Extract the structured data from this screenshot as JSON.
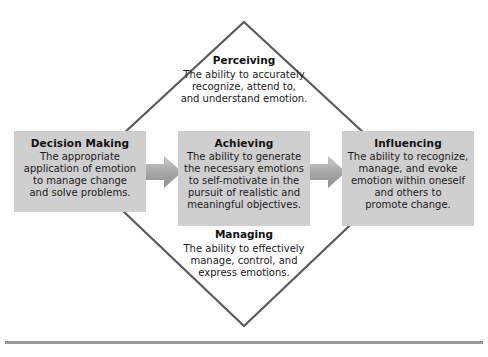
{
  "diagram": {
    "type": "emotional-intelligence-model",
    "shape": "diamond",
    "colors": {
      "box_fill": "#cfcfcf",
      "outline": "#5a5a5a",
      "arrow_fill": "#b0b0b0",
      "rule": "#9a9a9a",
      "text": "#1a1a1a"
    },
    "boxes": [
      {
        "id": "decision-making",
        "title": "Decision Making",
        "description": "The appropriate\napplication of emotion\nto manage change\nand solve problems."
      },
      {
        "id": "achieving",
        "title": "Achieving",
        "description": "The ability to generate\nthe necessary emotions\nto self-motivate in the\npursuit of realistic and\nmeaningful objectives."
      },
      {
        "id": "influencing",
        "title": "Influencing",
        "description": "The ability to recognize,\nmanage, and evoke\nemotion within oneself\nand others to\npromote change."
      }
    ],
    "free_texts": [
      {
        "id": "perceiving",
        "title": "Perceiving",
        "description": "The ability to accurately\nrecognize, attend to,\nand understand emotion."
      },
      {
        "id": "managing",
        "title": "Managing",
        "description": "The ability to effectively\nmanage, control, and\nexpress emotions."
      }
    ],
    "arrows": [
      {
        "id": "arrow-decision-to-achieving",
        "from": "decision-making",
        "to": "achieving"
      },
      {
        "id": "arrow-achieving-to-influencing",
        "from": "achieving",
        "to": "influencing"
      }
    ]
  }
}
